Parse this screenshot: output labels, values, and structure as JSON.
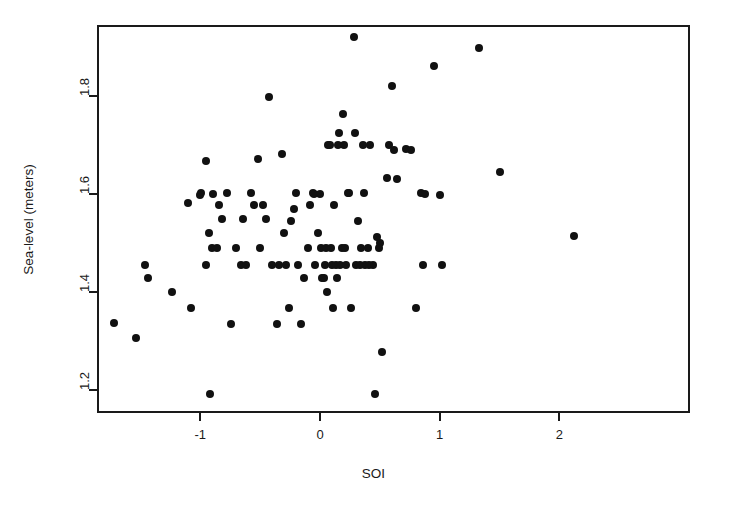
{
  "chart_data": {
    "type": "scatter",
    "title": "",
    "xlabel": "SOI",
    "ylabel": "Sea-level (meters)",
    "xlim": [
      -1.96,
      2.98
    ],
    "ylim": [
      1.156,
      1.948
    ],
    "xticks": [
      -1,
      0,
      1,
      2
    ],
    "xticklabels": [
      "-1",
      "0",
      "1",
      "2"
    ],
    "yticks": [
      1.2,
      1.4,
      1.6,
      1.8
    ],
    "yticklabels": [
      "1.2",
      "1.4",
      "1.6",
      "1.8"
    ],
    "grid": false,
    "legend": false,
    "marker": "filled-circle",
    "marker_color": "#111111",
    "marker_size_px": 8,
    "n_points": 110,
    "points": [
      [
        -1.72,
        1.337
      ],
      [
        -1.54,
        1.307
      ],
      [
        -1.46,
        1.455
      ],
      [
        -1.44,
        1.428
      ],
      [
        -1.24,
        1.399
      ],
      [
        -1.1,
        1.582
      ],
      [
        -1.08,
        1.367
      ],
      [
        -0.99,
        1.603
      ],
      [
        -0.95,
        1.668
      ],
      [
        -0.93,
        1.521
      ],
      [
        -0.92,
        1.192
      ],
      [
        -0.9,
        1.489
      ],
      [
        -0.89,
        1.601
      ],
      [
        -0.86,
        1.489
      ],
      [
        -0.84,
        1.578
      ],
      [
        -0.82,
        1.549
      ],
      [
        -0.78,
        1.603
      ],
      [
        -0.74,
        1.334
      ],
      [
        -0.66,
        1.455
      ],
      [
        -0.62,
        1.455
      ],
      [
        -0.58,
        1.603
      ],
      [
        -0.55,
        1.578
      ],
      [
        -0.52,
        1.672
      ],
      [
        -0.5,
        1.489
      ],
      [
        -0.45,
        1.549
      ],
      [
        -0.43,
        1.797
      ],
      [
        -0.4,
        1.455
      ],
      [
        -0.36,
        1.334
      ],
      [
        -0.34,
        1.455
      ],
      [
        -0.32,
        1.682
      ],
      [
        -0.3,
        1.521
      ],
      [
        -0.28,
        1.455
      ],
      [
        -0.26,
        1.367
      ],
      [
        -0.22,
        1.57
      ],
      [
        -0.2,
        1.603
      ],
      [
        -0.18,
        1.455
      ],
      [
        -0.16,
        1.334
      ],
      [
        -0.13,
        1.428
      ],
      [
        -0.1,
        1.489
      ],
      [
        -0.08,
        1.578
      ],
      [
        -0.06,
        1.603
      ],
      [
        -0.05,
        1.601
      ],
      [
        -0.04,
        1.455
      ],
      [
        -0.02,
        1.521
      ],
      [
        0.0,
        1.601
      ],
      [
        0.01,
        1.489
      ],
      [
        0.02,
        1.428
      ],
      [
        0.03,
        1.428
      ],
      [
        0.04,
        1.455
      ],
      [
        0.05,
        1.489
      ],
      [
        0.06,
        1.399
      ],
      [
        0.07,
        1.7
      ],
      [
        0.08,
        1.7
      ],
      [
        0.09,
        1.489
      ],
      [
        0.1,
        1.455
      ],
      [
        0.11,
        1.367
      ],
      [
        0.12,
        1.578
      ],
      [
        0.13,
        1.455
      ],
      [
        0.14,
        1.428
      ],
      [
        0.16,
        1.725
      ],
      [
        0.17,
        1.455
      ],
      [
        0.18,
        1.489
      ],
      [
        0.19,
        1.763
      ],
      [
        0.2,
        1.7
      ],
      [
        0.22,
        1.455
      ],
      [
        0.23,
        1.603
      ],
      [
        0.24,
        1.603
      ],
      [
        0.26,
        1.367
      ],
      [
        0.28,
        1.921
      ],
      [
        0.29,
        1.725
      ],
      [
        0.3,
        1.455
      ],
      [
        0.32,
        1.545
      ],
      [
        0.34,
        1.489
      ],
      [
        0.36,
        1.7
      ],
      [
        0.38,
        1.455
      ],
      [
        0.4,
        1.489
      ],
      [
        0.42,
        1.7
      ],
      [
        0.44,
        1.455
      ],
      [
        0.46,
        1.192
      ],
      [
        0.48,
        1.512
      ],
      [
        0.5,
        1.5
      ],
      [
        0.52,
        1.278
      ],
      [
        0.56,
        1.633
      ],
      [
        0.58,
        1.7
      ],
      [
        0.6,
        1.821
      ],
      [
        0.62,
        1.69
      ],
      [
        0.72,
        1.691
      ],
      [
        0.8,
        1.367
      ],
      [
        0.84,
        1.603
      ],
      [
        0.86,
        1.455
      ],
      [
        0.88,
        1.601
      ],
      [
        0.95,
        1.862
      ],
      [
        1.0,
        1.598
      ],
      [
        1.02,
        1.455
      ],
      [
        1.33,
        1.898
      ],
      [
        1.5,
        1.645
      ],
      [
        2.12,
        1.515
      ],
      [
        -0.64,
        1.548
      ],
      [
        -0.7,
        1.489
      ],
      [
        -0.48,
        1.578
      ],
      [
        -0.24,
        1.545
      ],
      [
        0.15,
        1.7
      ],
      [
        0.21,
        1.489
      ],
      [
        0.33,
        1.455
      ],
      [
        0.37,
        1.603
      ],
      [
        0.41,
        1.455
      ],
      [
        0.49,
        1.49
      ],
      [
        0.64,
        1.63
      ],
      [
        0.76,
        1.69
      ],
      [
        -1.0,
        1.598
      ],
      [
        -0.95,
        1.455
      ]
    ]
  },
  "geometry": {
    "plot_left": 97,
    "plot_top": 25,
    "plot_right": 690,
    "plot_bottom": 413,
    "x_px_per_unit": 119.7,
    "y_px_per_unit": 490.0,
    "x0_px": 320,
    "y_ref_val": 1.6,
    "y_ref_px": 194
  }
}
